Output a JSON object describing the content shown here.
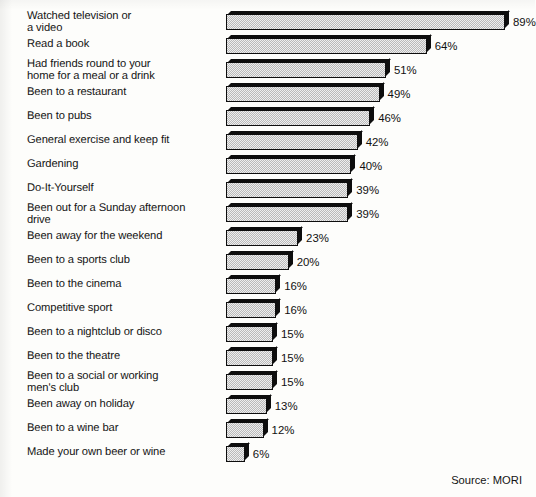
{
  "chart_data": {
    "type": "bar",
    "orientation": "horizontal",
    "title": "",
    "subtitle": "",
    "xlabel": "",
    "ylabel": "",
    "xlim": [
      0,
      100
    ],
    "grid": false,
    "legend": null,
    "value_suffix": "%",
    "categories": [
      "Watched television or\na video",
      "Read a book",
      "Had friends round to your\nhome for a meal or a drink",
      "Been to a restaurant",
      "Been to pubs",
      "General exercise and keep fit",
      "Gardening",
      "Do-It-Yourself",
      "Been out for a Sunday afternoon\ndrive",
      "Been away for the weekend",
      "Been to a sports club",
      "Been to the cinema",
      "Competitive sport",
      "Been to a nightclub or disco",
      "Been to the theatre",
      "Been to a social or working\nmen's club",
      "Been away on holiday",
      "Been to a wine bar",
      "Made your own beer or wine"
    ],
    "values": [
      89,
      64,
      51,
      49,
      46,
      42,
      40,
      39,
      39,
      23,
      20,
      16,
      16,
      15,
      15,
      15,
      13,
      12,
      6
    ],
    "value_labels": [
      "89%",
      "64%",
      "51%",
      "49%",
      "46%",
      "42%",
      "40%",
      "39%",
      "39%",
      "23%",
      "20%",
      "16%",
      "16%",
      "15%",
      "15%",
      "15%",
      "13%",
      "12%",
      "6%"
    ],
    "annotations": [
      "Source: MORI"
    ]
  },
  "footer": {
    "source": "Source: MORI"
  }
}
